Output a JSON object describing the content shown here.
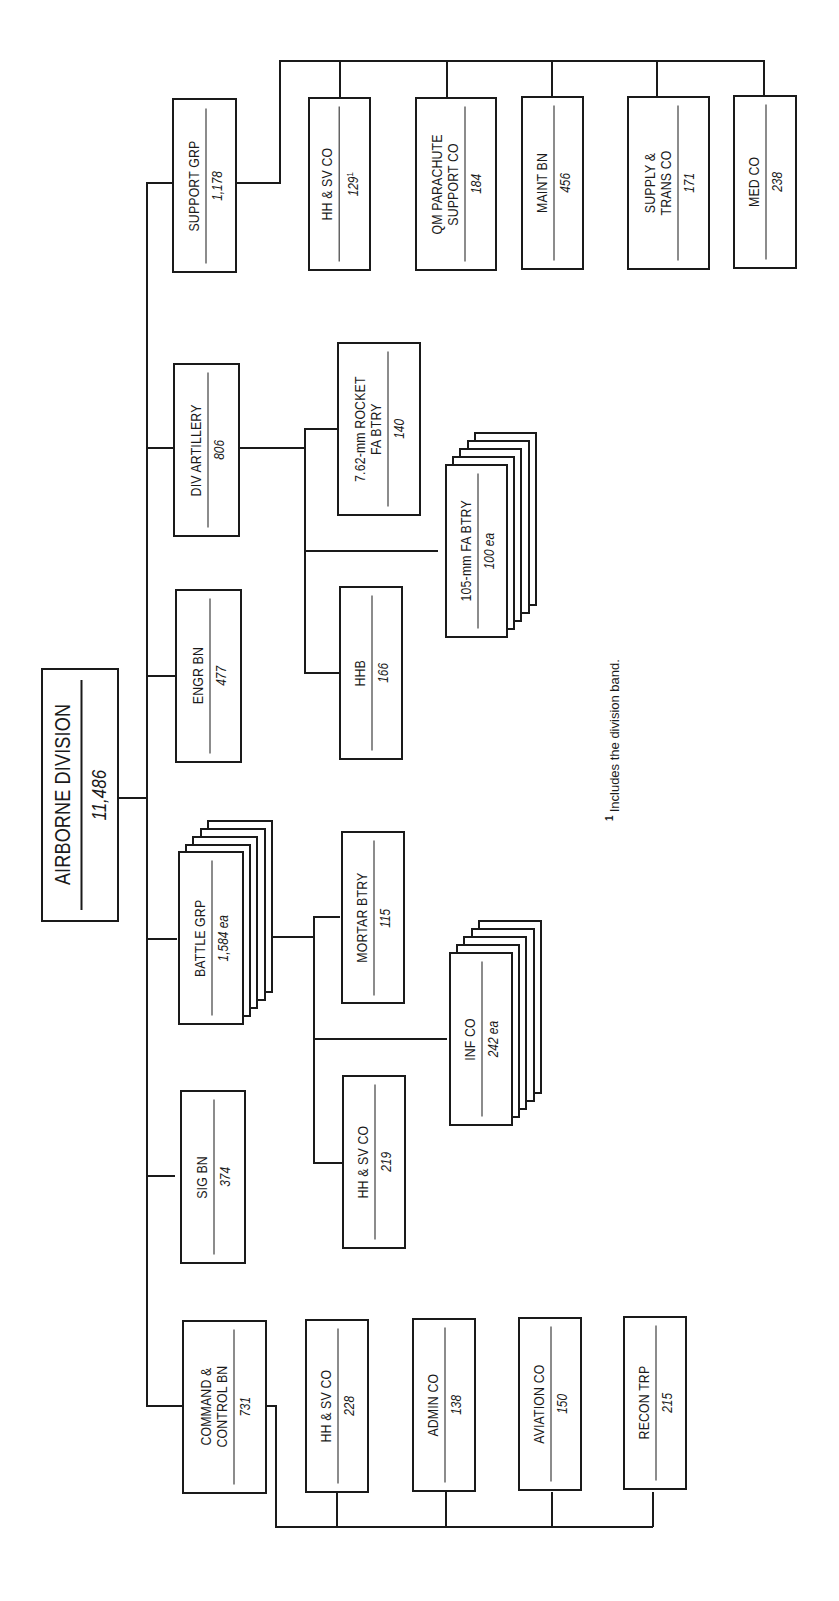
{
  "diagram": {
    "type": "org-chart",
    "orientation": "rotated-90-counterclockwise",
    "root": {
      "name": "AIRBORNE DIVISION",
      "strength": "11,486"
    },
    "units": [
      {
        "name": "COMMAND &\nCONTROL BN",
        "strength": "731",
        "children": [
          {
            "name": "HH & SV CO",
            "strength": "228"
          },
          {
            "name": "ADMIN CO",
            "strength": "138"
          },
          {
            "name": "AVIATION CO",
            "strength": "150"
          },
          {
            "name": "RECON TRP",
            "strength": "215"
          }
        ]
      },
      {
        "name": "SIG BN",
        "strength": "374"
      },
      {
        "name": "BATTLE GRP",
        "strength": "1,584 ea",
        "stacked": 5,
        "children": [
          {
            "name": "HH & SV CO",
            "strength": "219"
          },
          {
            "name": "INF CO",
            "strength": "242 ea",
            "stacked": 5
          },
          {
            "name": "MORTAR BTRY",
            "strength": "115"
          }
        ]
      },
      {
        "name": "ENGR BN",
        "strength": "477"
      },
      {
        "name": "DIV ARTILLERY",
        "strength": "806",
        "children": [
          {
            "name": "HHB",
            "strength": "166"
          },
          {
            "name": "105-mm FA BTRY",
            "strength": "100 ea",
            "stacked": 5
          },
          {
            "name": "7.62-mm ROCKET\nFA BTRY",
            "strength": "140"
          }
        ]
      },
      {
        "name": "SUPPORT GRP",
        "strength": "1,178",
        "children": [
          {
            "name": "HH & SV CO",
            "strength": "129",
            "footnote_ref": "1"
          },
          {
            "name": "QM PARACHUTE\nSUPPORT CO",
            "strength": "184"
          },
          {
            "name": "MAINT BN",
            "strength": "456"
          },
          {
            "name": "SUPPLY &\nTRANS CO",
            "strength": "171"
          },
          {
            "name": "MED CO",
            "strength": "238"
          }
        ]
      }
    ],
    "footnote": {
      "marker": "1",
      "text": "Includes the division band."
    }
  }
}
